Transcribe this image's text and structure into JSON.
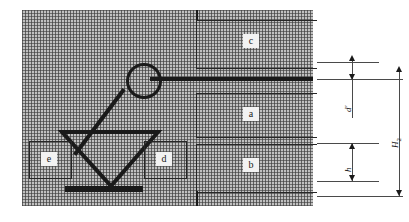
{
  "figure": {
    "type": "engineering-schematic",
    "background_fill": "#b9b9b9",
    "stroke_color": "#1a1a1a"
  },
  "regions": [
    {
      "key": "c",
      "label": "c"
    },
    {
      "key": "a",
      "label": "a"
    },
    {
      "key": "b",
      "label": "b"
    }
  ],
  "component_labels": [
    {
      "key": "e",
      "label": "e"
    },
    {
      "key": "d",
      "label": "d"
    }
  ],
  "dimensions": [
    {
      "key": "d_prime",
      "symbol": "d",
      "superscript": "'",
      "subscript": ""
    },
    {
      "key": "h",
      "symbol": "h",
      "superscript": "",
      "subscript": ""
    },
    {
      "key": "H2",
      "symbol": "H",
      "superscript": "",
      "subscript": "2"
    }
  ],
  "labels": {
    "region_c": "c",
    "region_a": "a",
    "region_b": "b",
    "part_e": "e",
    "part_d": "d",
    "dim_d_prime": "d′",
    "dim_h": "h",
    "dim_H2_base": "H",
    "dim_H2_sub": "2"
  }
}
